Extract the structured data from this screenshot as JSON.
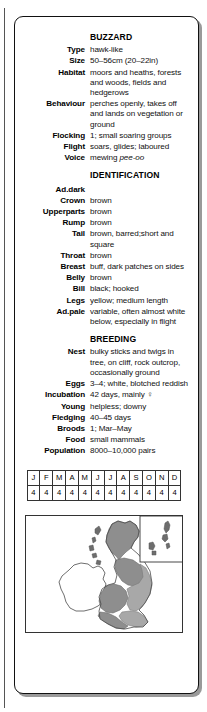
{
  "card": {
    "title": "BUZZARD",
    "sections": [
      {
        "heading": null,
        "rows": [
          {
            "label": "Type",
            "value": "hawk-like"
          },
          {
            "label": "Size",
            "value": "50–56cm (20–22in)"
          },
          {
            "label": "Habitat",
            "value": "moors and heaths, forests and woods, fields and hedgerows"
          },
          {
            "label": "Behaviour",
            "value": "perches openly, takes off and lands on vegetation or ground"
          },
          {
            "label": "Flocking",
            "value": "1; small soaring groups"
          },
          {
            "label": "Flight",
            "value": "soars, glides; laboured"
          },
          {
            "label": "Voice",
            "value": "mewing ",
            "value_italic": "pee-oo"
          }
        ]
      },
      {
        "heading": "IDENTIFICATION",
        "rows": [
          {
            "label": "Ad.dark",
            "value": ""
          },
          {
            "label": "Crown",
            "value": "brown"
          },
          {
            "label": "Upperparts",
            "value": "brown"
          },
          {
            "label": "Rump",
            "value": "brown"
          },
          {
            "label": "Tail",
            "value": "brown, barred;short and square"
          },
          {
            "label": "Throat",
            "value": "brown"
          },
          {
            "label": "Breast",
            "value": "buff, dark patches on sides"
          },
          {
            "label": "Belly",
            "value": "brown"
          },
          {
            "label": "Bill",
            "value": "black; hooked"
          },
          {
            "label": "Legs",
            "value": "yellow; medium length"
          },
          {
            "label": "Ad.pale",
            "value": "variable, often almost white below, especially in flight"
          }
        ]
      },
      {
        "heading": "BREEDING",
        "rows": [
          {
            "label": "Nest",
            "value": "bulky sticks and twigs in tree, on cliff, rock outcrop, occasionally ground"
          },
          {
            "label": "Eggs",
            "value": "3–4; white, blotched reddish"
          },
          {
            "label": "Incubation",
            "value": "42 days, mainly ♀"
          },
          {
            "label": "Young",
            "value": "helpless; downy"
          },
          {
            "label": "Fledging",
            "value": "40–45 days"
          },
          {
            "label": "Broods",
            "value": "1; Mar–May"
          },
          {
            "label": "Food",
            "value": "small mammals"
          },
          {
            "label": "Population",
            "value": "8000–10,000 pairs"
          }
        ]
      }
    ]
  },
  "calendar": {
    "months": [
      "J",
      "F",
      "M",
      "A",
      "M",
      "J",
      "J",
      "A",
      "S",
      "O",
      "N",
      "D"
    ],
    "status": [
      "4",
      "4",
      "4",
      "4",
      "4",
      "4",
      "4",
      "4",
      "4",
      "4",
      "4",
      "4"
    ]
  },
  "map": {
    "name": "distribution-map-uk",
    "inset_name": "shetland-orkney-inset",
    "colors": {
      "range_dark": "#8e8e8e",
      "range_mid": "#a8a8a8",
      "outline": "#4a4a4a",
      "frame": "#333333"
    }
  }
}
